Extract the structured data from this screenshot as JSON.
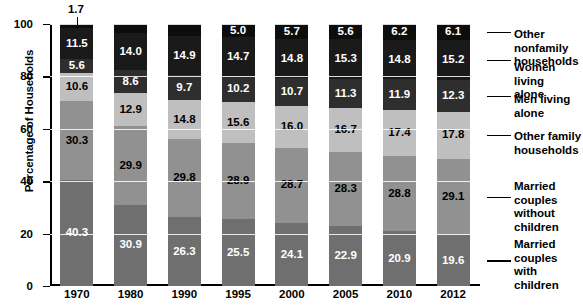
{
  "chart_data": {
    "type": "bar",
    "stacked": true,
    "title": "",
    "xlabel": "",
    "ylabel": "Percentage of Households",
    "ylim": [
      0,
      100
    ],
    "yticks": [
      0,
      20,
      40,
      60,
      80,
      100
    ],
    "grid": true,
    "legend_position": "right",
    "categories": [
      "1970",
      "1980",
      "1990",
      "1995",
      "2000",
      "2005",
      "2010",
      "2012"
    ],
    "series": [
      {
        "name": "Married couples with children",
        "color": "#6f6f6f",
        "label_color": "#ffffff",
        "values": [
          40.3,
          30.9,
          26.3,
          25.5,
          24.1,
          22.9,
          20.9,
          19.6
        ]
      },
      {
        "name": "Married couples without children",
        "color": "#919191",
        "label_color": "#000000",
        "values": [
          30.3,
          29.9,
          29.8,
          28.9,
          28.7,
          28.3,
          28.8,
          29.1
        ]
      },
      {
        "name": "Other family households",
        "color": "#bfbfbf",
        "label_color": "#000000",
        "values": [
          10.6,
          12.9,
          14.8,
          15.6,
          16.0,
          16.7,
          17.4,
          17.8
        ]
      },
      {
        "name": "Men living alone",
        "color": "#2e2e2e",
        "label_color": "#ffffff",
        "values": [
          5.6,
          8.6,
          9.7,
          10.2,
          10.7,
          11.3,
          11.9,
          12.3
        ]
      },
      {
        "name": "Women living alone",
        "color": "#1a1a1a",
        "label_color": "#ffffff",
        "values": [
          11.5,
          14.0,
          14.9,
          14.7,
          14.8,
          15.3,
          14.8,
          15.2
        ]
      },
      {
        "name": "Other nonfamily households",
        "color": "#0d0d0d",
        "label_color": "#ffffff",
        "values": [
          1.7,
          3.6,
          4.6,
          5.0,
          5.7,
          5.6,
          6.2,
          6.1
        ]
      }
    ],
    "annotations": [
      {
        "text": "1.7",
        "category": "1970",
        "series": "Other nonfamily households",
        "note": "external callout with leader line to thin top segment"
      }
    ]
  },
  "legend": {
    "items": [
      {
        "label": "Other nonfamily\nhouseholds"
      },
      {
        "label": "Women living\nalone"
      },
      {
        "label": "Men living alone"
      },
      {
        "label": "Other family\nhouseholds"
      },
      {
        "label": "Married couples\nwithout children"
      },
      {
        "label": "Married couples\nwith children"
      }
    ]
  }
}
